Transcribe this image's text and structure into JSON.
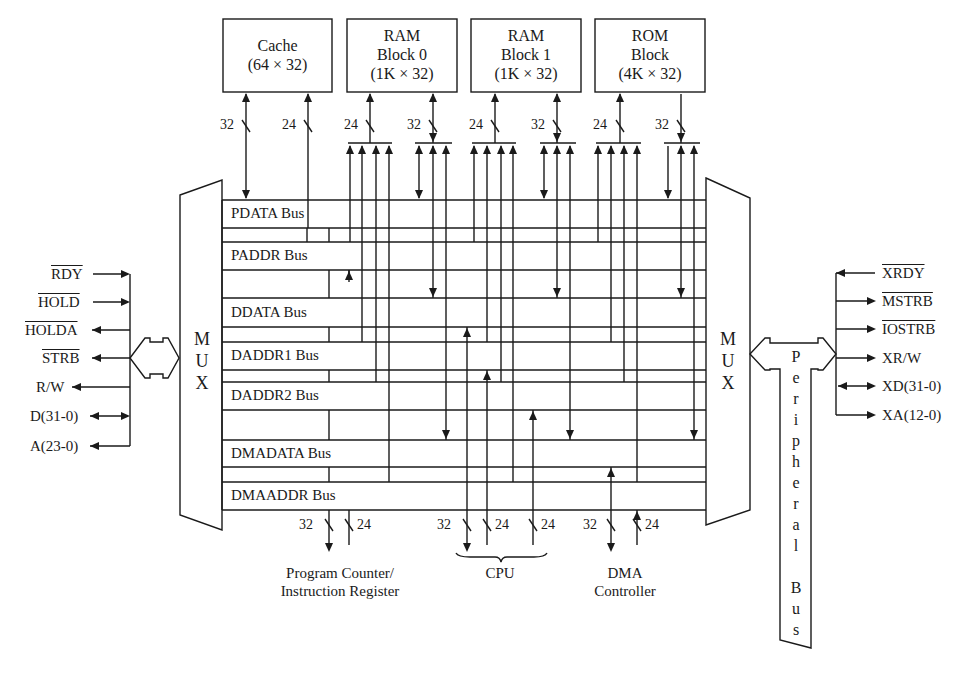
{
  "memory_blocks": [
    {
      "name": "Cache",
      "size": "(64 × 32)"
    },
    {
      "name": "RAM",
      "name2": "Block 0",
      "size": "(1K × 32)"
    },
    {
      "name": "RAM",
      "name2": "Block 1",
      "size": "(1K × 32)"
    },
    {
      "name": "ROM",
      "name2": "Block",
      "size": "(4K × 32)"
    }
  ],
  "top_widths": [
    "32",
    "24",
    "24",
    "32",
    "24",
    "32",
    "24",
    "32"
  ],
  "buses": [
    "PDATA Bus",
    "PADDR Bus",
    "DDATA Bus",
    "DADDR1 Bus",
    "DADDR2 Bus",
    "DMADATA Bus",
    "DMAADDR Bus"
  ],
  "mux_left": {
    "letters": [
      "M",
      "U",
      "X"
    ]
  },
  "mux_right": {
    "letters": [
      "M",
      "U",
      "X"
    ]
  },
  "left_signals": [
    "RDY",
    "HOLD",
    "HOLDA",
    "STRB",
    "R/W",
    "D(31-0)",
    "A(23-0)"
  ],
  "left_signals_overline": [
    true,
    true,
    true,
    true,
    false,
    false,
    false
  ],
  "right_signals": [
    "XRDY",
    "MSTRB",
    "IOSTRB",
    "XR/W",
    "XD(31-0)",
    "XA(12-0)"
  ],
  "right_signals_overline": [
    true,
    true,
    true,
    false,
    false,
    false
  ],
  "peripheral_bus": {
    "letters": [
      "P",
      "e",
      "r",
      "i",
      "p",
      "h",
      "e",
      "r",
      "a",
      "l",
      "",
      "B",
      "u",
      "s"
    ]
  },
  "bottom_widths": [
    "32",
    "24",
    "32",
    "24",
    "24",
    "32",
    "24"
  ],
  "bottom_units": {
    "pc_ir": {
      "line1": "Program Counter/",
      "line2": "Instruction Register"
    },
    "cpu": {
      "label": "CPU"
    },
    "dma": {
      "line1": "DMA",
      "line2": "Controller"
    }
  }
}
